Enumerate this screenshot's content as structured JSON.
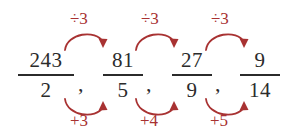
{
  "figure": {
    "kind": "math-fraction-sequence",
    "accent_color": "#a83232",
    "text_color": "#2b2b2b",
    "background": "#ffffff",
    "separator": ","
  },
  "sequence": {
    "terms": [
      {
        "numerator": "243",
        "denominator": "2"
      },
      {
        "numerator": "81",
        "denominator": "5"
      },
      {
        "numerator": "27",
        "denominator": "9"
      },
      {
        "numerator": "9",
        "denominator": "14"
      }
    ]
  },
  "annotations": {
    "top": [
      {
        "label": "÷3",
        "direction": "right"
      },
      {
        "label": "÷3",
        "direction": "right"
      },
      {
        "label": "÷3",
        "direction": "right"
      }
    ],
    "bottom": [
      {
        "label": "+3",
        "direction": "right"
      },
      {
        "label": "+4",
        "direction": "right"
      },
      {
        "label": "+5",
        "direction": "right"
      }
    ]
  }
}
